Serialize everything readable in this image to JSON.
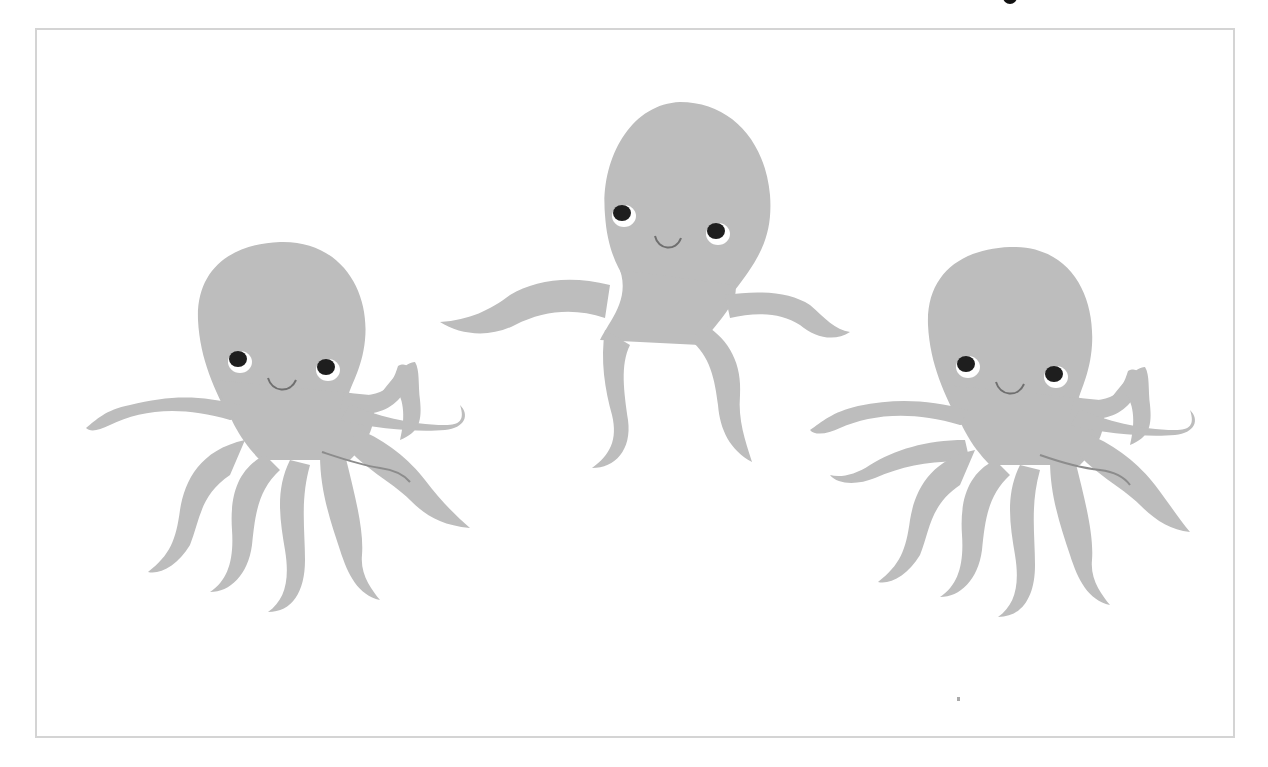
{
  "image": {
    "description": "Three cartoon grey octopuses with smiling faces on a white background inside a thin light-grey frame",
    "subjects": [
      {
        "name": "left octopus",
        "position": "left",
        "pose": "tentacles spread, curling"
      },
      {
        "name": "center octopus",
        "position": "center-top",
        "pose": "arms spread wide, four tentacles"
      },
      {
        "name": "right octopus",
        "position": "right",
        "pose": "tentacles spread, curling"
      }
    ],
    "colors": {
      "body": "#bdbdbd",
      "body_shade": "#b3b3b3",
      "eye": "#1e1e1e",
      "eye_white": "#ffffff",
      "mouth": "#6f6f6f",
      "frame": "#d4d4d4",
      "background": "#ffffff"
    }
  }
}
